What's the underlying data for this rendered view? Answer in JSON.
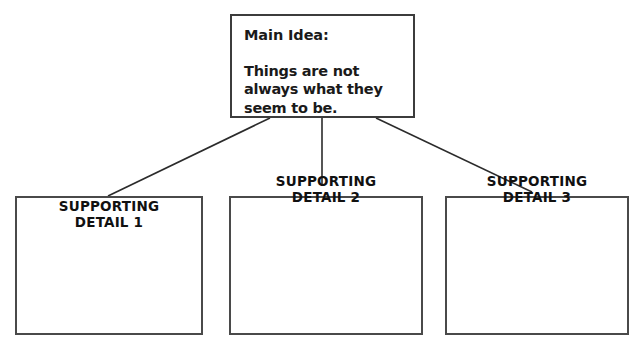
{
  "diagram": {
    "title_node": {
      "heading": "Main Idea:",
      "statement": "Things are not always what they seem to be."
    },
    "supporting_nodes": [
      {
        "line1": "SUPPORTING",
        "line2": "DETAIL 1",
        "body": ""
      },
      {
        "line1": "SUPPORTING",
        "line2": "DETAIL 2",
        "body": ""
      },
      {
        "line1": "SUPPORTING",
        "line2": "DETAIL 3",
        "body": ""
      }
    ],
    "colors": {
      "background": "#ffffff",
      "border": "#4a4a4a",
      "text": "#1a1a1a",
      "connector": "#2b2b2b"
    }
  }
}
